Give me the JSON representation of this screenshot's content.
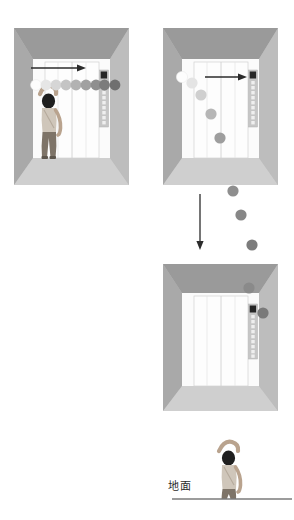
{
  "figure": {
    "title_text": "",
    "label_ground": "地面",
    "colors": {
      "wall": "#b4b4b4",
      "wall_left": "#a8a8a8",
      "wall_right": "#bdbdbd",
      "ceiling": "#9a9a9a",
      "floor": "#cfcfcf",
      "door": "#fbfbfb",
      "door_line": "#c9c9c9",
      "panel_strip": "#c4c4c4",
      "panel_button_dark": "#262626",
      "panel_button_light": "#ececec",
      "arrow": "#2b2b2b",
      "ground_line": "#3a3a3a",
      "person_skin": "#b9a38e",
      "person_hair": "#1f1f1f",
      "person_shirt": "#cfc6ba",
      "person_pants": "#7e7468",
      "ball_lightest": "#f2f2f2",
      "ball_darkest": "#6f6f6f"
    }
  },
  "panels": [
    {
      "id": "panel-1",
      "name": "elevator-throw-horizontal",
      "description": "person inside elevator throwing ball horizontally",
      "has_person": true,
      "arrow": {
        "type": "horizontal-right",
        "label": ""
      },
      "ball_trail": {
        "type": "horizontal",
        "count": 9,
        "shades": [
          "#fdfdfd",
          "#e3e3e3",
          "#d2d2d2",
          "#c0c0c0",
          "#b0b0b0",
          "#a0a0a0",
          "#909090",
          "#7e7e7e",
          "#6f6f6f"
        ]
      }
    },
    {
      "id": "panel-2",
      "name": "elevator-ball-parabola",
      "description": "ball follows parabolic arc downward out of elevator",
      "has_person": false,
      "arrow": {
        "type": "horizontal-right",
        "label": ""
      },
      "ball_trail": {
        "type": "parabola",
        "count": 5,
        "shades": [
          "#fdfdfd",
          "#e6e6e6",
          "#cfcfcf",
          "#b2b2b2",
          "#9a9a9a"
        ]
      }
    },
    {
      "id": "panel-3",
      "name": "elevator-ball-rising",
      "description": "elevator with two balls near control panel",
      "has_person": false,
      "arrow": {
        "type": "none",
        "label": ""
      },
      "ball_trail": {
        "type": "pair",
        "count": 2,
        "shades": [
          "#8a8a8a",
          "#7a7a7a"
        ]
      }
    }
  ],
  "connector_arrow": {
    "name": "downward-transition-arrow",
    "direction": "down",
    "label": ""
  },
  "falling_balls": {
    "name": "falling-ball-sequence",
    "count": 3,
    "shades": [
      "#8e8e8e",
      "#848484",
      "#7a7a7a"
    ]
  },
  "ground_scene": {
    "name": "ground-observer",
    "label": "地面",
    "has_person": true,
    "ground_line": true
  },
  "control_panel": {
    "name": "elevator-control-panel",
    "display_label": "",
    "button_rows": 9
  }
}
